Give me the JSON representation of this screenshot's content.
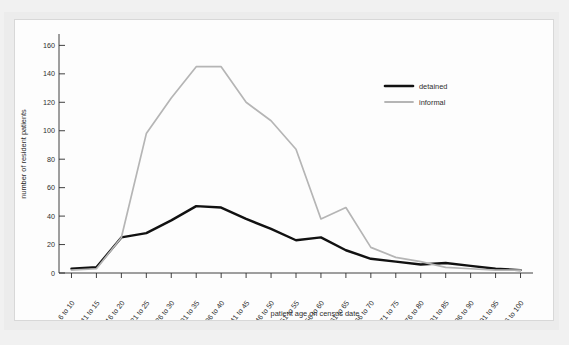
{
  "chart_data": {
    "type": "line",
    "title": "",
    "xlabel": "patient age on census date",
    "ylabel": "number of resident patients",
    "categories": [
      "6 to 10",
      "11 to 15",
      "16 to 20",
      "21 to 25",
      "26 to 30",
      "31 to 35",
      "36 to 40",
      "41 to 45",
      "46 to 50",
      "51 to 55",
      "56 to 60",
      "61 to 65",
      "66 to 70",
      "71 to 75",
      "76 to 80",
      "81 to 85",
      "86 to 90",
      "91 to 95",
      "96 to 100"
    ],
    "series": [
      {
        "name": "detained",
        "color": "#111111",
        "values": [
          3,
          4,
          25,
          28,
          37,
          47,
          46,
          38,
          31,
          23,
          25,
          16,
          10,
          8,
          6,
          7,
          5,
          3,
          2
        ]
      },
      {
        "name": "informal",
        "color": "#b5b5b5",
        "values": [
          2,
          3,
          25,
          98,
          123,
          145,
          145,
          120,
          107,
          87,
          38,
          46,
          18,
          11,
          8,
          4,
          3,
          2,
          2
        ]
      }
    ],
    "ylim": [
      0,
      168
    ],
    "yticks": [
      0,
      20,
      40,
      60,
      80,
      100,
      120,
      140,
      160
    ],
    "ytick_labels": [
      "0",
      "20",
      "40",
      "60",
      "80",
      "100",
      "120",
      "140",
      "160"
    ],
    "grid": false,
    "legend_position": "upper right"
  },
  "legend": {
    "entries": [
      {
        "label": "detained"
      },
      {
        "label": "informal"
      }
    ]
  },
  "axes": {
    "y_title": "number of resident patients",
    "x_title": "patient age on census date"
  }
}
